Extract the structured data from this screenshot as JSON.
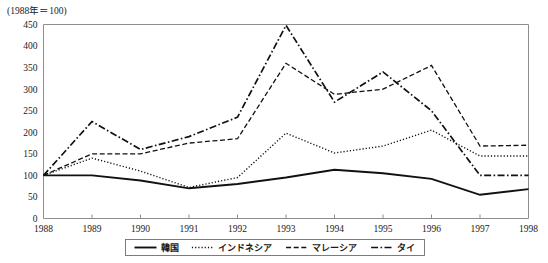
{
  "chart_data": {
    "type": "line",
    "title": "(1988年＝100)",
    "xlabel": "",
    "ylabel": "",
    "ylim": [
      0,
      450
    ],
    "yticks": [
      0,
      50,
      100,
      150,
      200,
      250,
      300,
      350,
      400,
      450
    ],
    "grid": false,
    "legend_position": "bottom",
    "categories": [
      "1988",
      "1989",
      "1990",
      "1991",
      "1992",
      "1993",
      "1994",
      "1995",
      "1996",
      "1997",
      "1998"
    ],
    "series": [
      {
        "name": "韓国",
        "style": "solid",
        "values": [
          100,
          100,
          88,
          70,
          80,
          95,
          113,
          105,
          92,
          55,
          68
        ]
      },
      {
        "name": "インドネシア",
        "style": "dotted",
        "values": [
          100,
          140,
          110,
          72,
          95,
          198,
          152,
          168,
          205,
          145,
          145
        ]
      },
      {
        "name": "マレーシア",
        "style": "dashed",
        "values": [
          100,
          150,
          150,
          175,
          185,
          360,
          288,
          300,
          355,
          168,
          170
        ]
      },
      {
        "name": "タイ",
        "style": "dashdot",
        "values": [
          100,
          225,
          160,
          190,
          235,
          448,
          270,
          340,
          250,
          100,
          100
        ]
      }
    ]
  },
  "legend": {
    "items": [
      {
        "label": "韓国",
        "style": "solid"
      },
      {
        "label": "インドネシア",
        "style": "dotted"
      },
      {
        "label": "マレーシア",
        "style": "dashed"
      },
      {
        "label": "タイ",
        "style": "dashdot"
      }
    ]
  }
}
